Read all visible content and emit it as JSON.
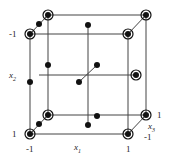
{
  "diagram": {
    "type": "box-behnken-like design cube",
    "axes": {
      "x1": {
        "label": "x",
        "sub": "1",
        "min": "-1",
        "max": "1"
      },
      "x2": {
        "label": "x",
        "sub": "2",
        "top": "-1",
        "bottom": "1"
      },
      "x3": {
        "label": "x",
        "sub": "3",
        "near": "-1",
        "far": "1"
      }
    },
    "colors": {
      "line": "#333333",
      "point": "#111111",
      "ring": "#111111"
    }
  }
}
